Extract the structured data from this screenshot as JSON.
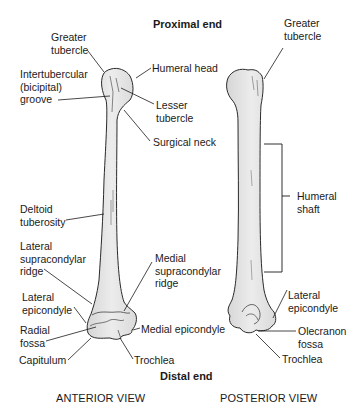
{
  "titles": {
    "proximal": "Proximal end",
    "distal": "Distal end"
  },
  "views": {
    "anterior": "ANTERIOR VIEW",
    "posterior": "POSTERIOR VIEW"
  },
  "anterior_labels": {
    "greater_tubercle": [
      "Greater",
      "tubercle"
    ],
    "intertubercular_groove": [
      "Intertubercular",
      "(bicipital)",
      "groove"
    ],
    "humeral_head": "Humeral head",
    "lesser_tubercle": [
      "Lesser",
      "tubercle"
    ],
    "surgical_neck": "Surgical neck",
    "deltoid_tuberosity": [
      "Deltoid",
      "tuberosity"
    ],
    "lateral_supracondylar_ridge": [
      "Lateral",
      "supracondylar",
      "ridge"
    ],
    "medial_supracondylar_ridge": [
      "Medial",
      "supracondylar",
      "ridge"
    ],
    "lateral_epicondyle": [
      "Lateral",
      "epicondyle"
    ],
    "radial_fossa": [
      "Radial",
      "fossa"
    ],
    "medial_epicondyle": "Medial epicondyle",
    "capitulum": "Capitulum",
    "trochlea": "Trochlea"
  },
  "posterior_labels": {
    "greater_tubercle": [
      "Greater",
      "tubercle"
    ],
    "humeral_shaft": [
      "Humeral",
      "shaft"
    ],
    "lateral_epicondyle": [
      "Lateral",
      "epicondyle"
    ],
    "olecranon_fossa": [
      "Olecranon",
      "fossa"
    ],
    "trochlea": "Trochlea"
  },
  "colors": {
    "bone_fill": "#e4e4e4",
    "bone_stroke": "#2a2a2a",
    "leader": "#1a1a1a",
    "background": "#ffffff"
  }
}
